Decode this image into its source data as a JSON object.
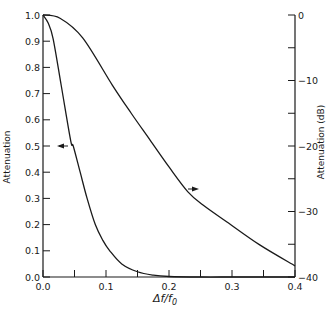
{
  "chart_data": {
    "type": "line",
    "title": "",
    "xlabel": "Δf/f0",
    "ylabel_left": "Attenuation",
    "ylabel_right": "Attenuation (dB)",
    "xlim": [
      0.0,
      0.4
    ],
    "ylim_left": [
      0.0,
      1.0
    ],
    "ylim_right": [
      -40,
      0
    ],
    "grid": false,
    "x_ticks": [
      "0.0",
      "0.1",
      "0.2",
      "0.3",
      "0.4"
    ],
    "x_minor_ticks": [
      0.05,
      0.15,
      0.25,
      0.35
    ],
    "y_left_ticks": [
      "0.0",
      "0.1",
      "0.2",
      "0.3",
      "0.4",
      "0.5",
      "0.6",
      "0.7",
      "0.8",
      "0.9",
      "1.0"
    ],
    "y_right_ticks": [
      "0",
      "-10",
      "-20",
      "-30",
      "-40"
    ],
    "y_right_minor_ticks": [
      -5,
      -15,
      -25,
      -35
    ],
    "series": [
      {
        "name": "Attenuation (linear)",
        "axis": "left",
        "arrow": "left",
        "x": [
          0.0,
          0.008,
          0.016,
          0.029,
          0.044,
          0.048,
          0.059,
          0.07,
          0.083,
          0.095,
          0.106,
          0.125,
          0.15,
          0.175,
          0.2,
          0.25,
          0.3,
          0.35,
          0.4
        ],
        "values": [
          1.0,
          0.97,
          0.91,
          0.73,
          0.52,
          0.5,
          0.4,
          0.3,
          0.2,
          0.14,
          0.1,
          0.05,
          0.02,
          0.007,
          0.002,
          0.0,
          0.0,
          0.0,
          0.0
        ]
      },
      {
        "name": "Attenuation (dB)",
        "axis": "right",
        "arrow": "right",
        "x": [
          0.0,
          0.027,
          0.063,
          0.11,
          0.14,
          0.17,
          0.2,
          0.23,
          0.254,
          0.292,
          0.344,
          0.4
        ],
        "values": [
          0.0,
          -0.5,
          -3.5,
          -10.7,
          -15.0,
          -19.1,
          -23.2,
          -27.0,
          -29.0,
          -31.6,
          -35.1,
          -38.3
        ]
      }
    ],
    "annotations": [
      {
        "type": "arrow",
        "points_to": "left axis",
        "at_x": 0.045,
        "at_y": 0.5
      },
      {
        "type": "arrow",
        "points_to": "right axis",
        "at_x": 0.23,
        "at_y_db": -26.5
      }
    ]
  }
}
